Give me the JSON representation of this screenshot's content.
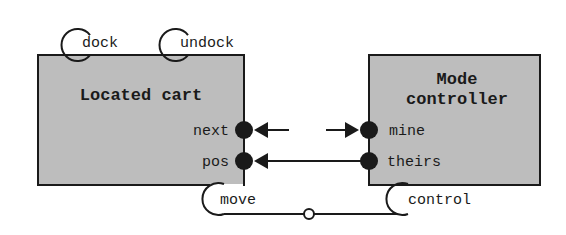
{
  "diagram": {
    "colors": {
      "box_fill": "#bdbdbd",
      "stroke": "#1a1a1a",
      "background": "#ffffff"
    },
    "components": [
      {
        "id": "located-cart",
        "title_lines": [
          "Located cart"
        ],
        "ports": [
          {
            "name": "next",
            "side": "right"
          },
          {
            "name": "pos",
            "side": "right"
          }
        ],
        "operations": [
          {
            "name": "dock",
            "side": "top"
          },
          {
            "name": "undock",
            "side": "top"
          },
          {
            "name": "move",
            "side": "bottom"
          }
        ]
      },
      {
        "id": "mode-controller",
        "title_lines": [
          "Mode",
          "controller"
        ],
        "ports": [
          {
            "name": "mine",
            "side": "left"
          },
          {
            "name": "theirs",
            "side": "left"
          }
        ],
        "operations": [
          {
            "name": "control",
            "side": "bottom"
          }
        ]
      }
    ],
    "connections": [
      {
        "from": "mine",
        "to": "next",
        "style": "broken-arrow"
      },
      {
        "from": "theirs",
        "to": "pos",
        "style": "arrow"
      },
      {
        "from": "move",
        "to": "control",
        "style": "line-with-circle"
      }
    ]
  },
  "labels": {
    "dock": "dock",
    "undock": "undock",
    "located_cart": "Located cart",
    "next": "next",
    "pos": "pos",
    "move": "move",
    "mode": "Mode",
    "controller": "controller",
    "mine": "mine",
    "theirs": "theirs",
    "control": "control"
  }
}
